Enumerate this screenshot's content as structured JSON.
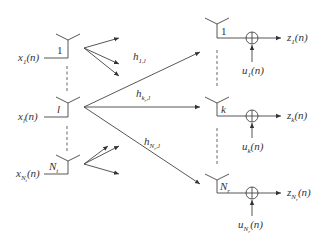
{
  "diagram": {
    "type": "MIMO channel block diagram",
    "transmit_antennas": [
      {
        "index_label": "1",
        "input_label": "x",
        "input_sub": "1",
        "input_arg": "(n)"
      },
      {
        "index_label": "l",
        "input_label": "x",
        "input_sub": "l",
        "input_arg": "(n)"
      },
      {
        "index_label": "N",
        "index_sub": "t",
        "input_label": "x",
        "input_sub": "N",
        "input_subsub": "t",
        "input_arg": "(n)"
      }
    ],
    "channel_gains": [
      {
        "label": "h",
        "sub": "1,l"
      },
      {
        "label": "h",
        "sub": "k,l",
        "sub_k_sub": "r"
      },
      {
        "label": "h",
        "sub": "N",
        "sub_sub": "r",
        "sub_tail": ",l"
      }
    ],
    "receive_antennas": [
      {
        "index_label": "1",
        "noise_label": "u",
        "noise_sub": "1",
        "noise_arg": "(n)",
        "output_label": "z",
        "output_sub": "1",
        "output_arg": "(n)"
      },
      {
        "index_label": "k",
        "noise_label": "u",
        "noise_sub": "k",
        "noise_arg": "(n)",
        "output_label": "z",
        "output_sub": "k",
        "output_arg": "(n)"
      },
      {
        "index_label": "N",
        "index_sub": "r",
        "noise_label": "u",
        "noise_sub": "N",
        "noise_subsub": "r",
        "noise_arg": "(n)",
        "output_label": "z",
        "output_sub": "N",
        "output_subsub": "r",
        "output_arg": "(n)"
      }
    ],
    "adder_symbol": "⊕"
  }
}
